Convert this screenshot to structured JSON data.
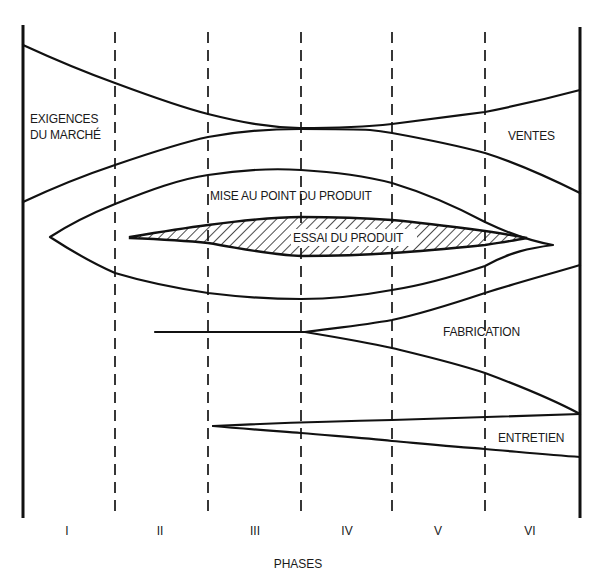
{
  "diagram": {
    "type": "product-development-phase-flow",
    "axis_title": "PHASES",
    "phases": [
      {
        "label": "I",
        "x": 67
      },
      {
        "label": "II",
        "x": 160
      },
      {
        "label": "III",
        "x": 255
      },
      {
        "label": "IV",
        "x": 347
      },
      {
        "label": "V",
        "x": 438
      },
      {
        "label": "VI",
        "x": 530
      }
    ],
    "streams": {
      "market_requirements": {
        "line1": "EXIGENCES",
        "line2": "DU MARCHÉ"
      },
      "sales": "VENTES",
      "product_development": "MISE AU POINT DU PRODUIT",
      "product_testing": "ESSAI DU PRODUIT",
      "manufacturing": "FABRICATION",
      "maintenance": "ENTRETIEN"
    },
    "colors": {
      "ink": "#111111",
      "background": "#ffffff"
    }
  }
}
